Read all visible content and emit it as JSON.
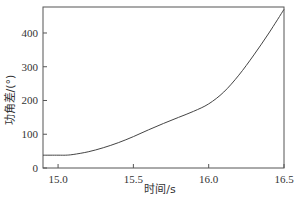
{
  "chart_data": {
    "type": "line",
    "title": "",
    "xlabel": "时间/s",
    "ylabel": "功角差/(°)",
    "xlim": [
      14.9,
      16.5
    ],
    "ylim": [
      0,
      477
    ],
    "xticks": [
      "15.0",
      "15.5",
      "16.0",
      "16.5"
    ],
    "yticks": [
      "0",
      "100",
      "200",
      "300",
      "400"
    ],
    "grid": false,
    "legend": null,
    "series": [
      {
        "name": "功角差",
        "x": [
          14.9,
          15.0,
          15.05,
          15.1,
          15.2,
          15.3,
          15.4,
          15.5,
          15.6,
          15.7,
          15.8,
          15.9,
          16.0,
          16.1,
          16.2,
          16.3,
          16.4,
          16.5
        ],
        "values": [
          38,
          38,
          38,
          40,
          48,
          60,
          75,
          93,
          113,
          132,
          150,
          168,
          190,
          225,
          275,
          335,
          400,
          470
        ]
      }
    ]
  }
}
